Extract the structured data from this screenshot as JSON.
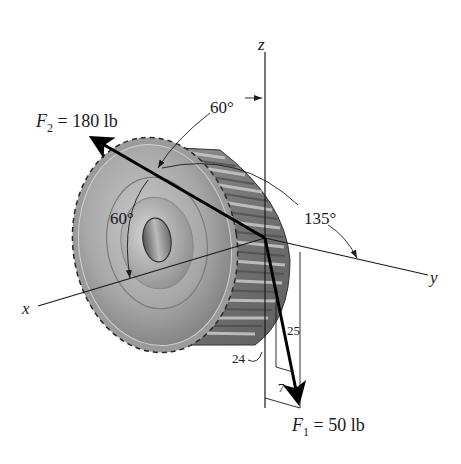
{
  "figure": {
    "type": "3D force diagram",
    "object": "spur gear (pulley) with hub",
    "origin": {
      "x": 265,
      "y": 238
    },
    "axes": [
      {
        "name": "x",
        "label": "x",
        "end": {
          "x": 38,
          "y": 306
        }
      },
      {
        "name": "y",
        "label": "y",
        "end": {
          "x": 428,
          "y": 275
        }
      },
      {
        "name": "z",
        "label": "z",
        "end": {
          "x": 265,
          "y": 52
        }
      }
    ],
    "forces": [
      {
        "id": "F2",
        "symbol": "F",
        "subscript": "2",
        "label_rest": " = 180 lb",
        "magnitude": 180,
        "unit": "lb",
        "tip": {
          "x": 88,
          "y": 135
        },
        "angles": [
          {
            "label": "60°",
            "measured_from": "z"
          },
          {
            "label": "60°",
            "measured_from": "x"
          },
          {
            "label": "135°",
            "measured_from": "y"
          }
        ]
      },
      {
        "id": "F1",
        "symbol": "F",
        "subscript": "1",
        "label_rest": " = 50 lb",
        "magnitude": 50,
        "unit": "lb",
        "tip": {
          "x": 300,
          "y": 408
        },
        "slope_triangle": {
          "legs": [
            "24",
            "7"
          ],
          "hypotenuse": "25"
        }
      }
    ],
    "labels": {
      "angle_z": "60°",
      "angle_x": "60°",
      "angle_y": "135°",
      "dim_24": "24",
      "dim_25": "25",
      "dim_7": "7",
      "axis_x": "x",
      "axis_y": "y",
      "axis_z": "z",
      "f2_sym": "F",
      "f2_sub": "2",
      "f2_rest": " = 180 lb",
      "f1_sym": "F",
      "f1_sub": "1",
      "f1_rest": " = 50 lb"
    },
    "colors": {
      "gear_light": "#bdbdbd",
      "gear_mid": "#8f8f8f",
      "gear_dark": "#5a5a5a",
      "line": "#1a1a1a",
      "force": "#000000"
    }
  }
}
